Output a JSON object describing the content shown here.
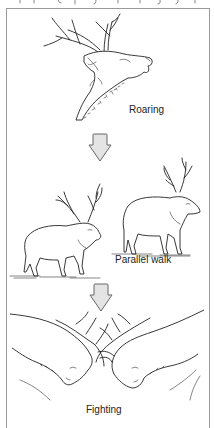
{
  "figure": {
    "title_cut_text": "",
    "stages": [
      {
        "id": "roaring",
        "label": "Roaring"
      },
      {
        "id": "parallel-walk",
        "label": "Parallel walk"
      },
      {
        "id": "fighting",
        "label": "Fighting"
      }
    ],
    "arrows": [
      {
        "from": "roaring",
        "to": "parallel-walk",
        "icon": "down-arrow-icon"
      },
      {
        "from": "parallel-walk",
        "to": "fighting",
        "icon": "down-arrow-icon"
      }
    ],
    "colors": {
      "frame": "#9a9a9a",
      "ink": "#222222",
      "arrow_fill": "#e4e4e4",
      "arrow_stroke": "#666666"
    }
  }
}
